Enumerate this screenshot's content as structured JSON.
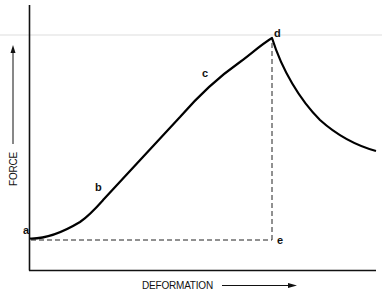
{
  "diagram": {
    "type": "force-deformation-curve",
    "x_axis_label": "DEFORMATION",
    "y_axis_label": "FORCE",
    "points": [
      {
        "id": "a",
        "label": "a",
        "x": 32,
        "y": 239,
        "label_x": 23,
        "label_y": 234
      },
      {
        "id": "b",
        "label": "b",
        "x": 100,
        "y": 195,
        "label_x": 95,
        "label_y": 191
      },
      {
        "id": "c",
        "label": "c",
        "x": 210,
        "y": 80,
        "label_x": 202,
        "label_y": 76
      },
      {
        "id": "d",
        "label": "d",
        "x": 272,
        "y": 38,
        "label_x": 274,
        "label_y": 37
      },
      {
        "id": "e",
        "label": "e",
        "x": 272,
        "y": 240,
        "label_x": 277,
        "label_y": 244
      }
    ],
    "colors": {
      "curve": "#000000",
      "axes": "#111111",
      "dashed": "#222222",
      "guide": "#cccccc"
    }
  }
}
